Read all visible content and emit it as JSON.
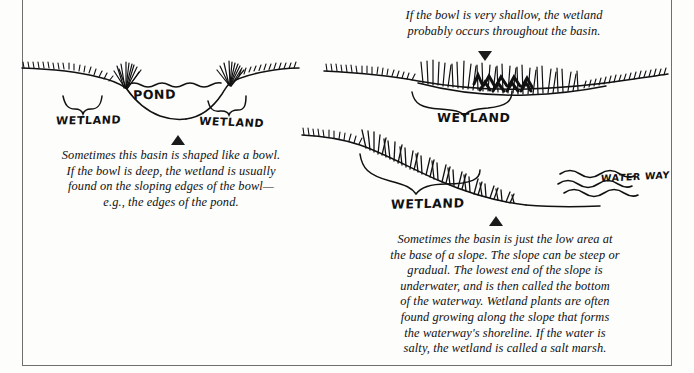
{
  "page": {
    "width": 694,
    "height": 373,
    "background_color": "#fdfdfc",
    "ink_color": "#111111",
    "rule_color": "#6f6f6f"
  },
  "figures": {
    "pond": {
      "name": "bowl-shaped basin with pond",
      "labels": {
        "water": "POND",
        "wetland_left": "WETLAND",
        "wetland_right": "WETLAND"
      },
      "marker": "triangle-up",
      "caption": [
        "Sometimes this basin is shaped like a bowl.",
        "If the bowl is deep, the wetland is usually",
        "found on the sloping edges of the bowl—",
        "e.g., the edges of the pond."
      ]
    },
    "shallow": {
      "name": "very shallow basin filled with wetland",
      "labels": {
        "wetland": "WETLAND"
      },
      "marker": "triangle-down",
      "caption": [
        "If the bowl is very shallow, the wetland",
        "probably occurs throughout the basin."
      ]
    },
    "slope": {
      "name": "low area at base of a slope beside a waterway",
      "labels": {
        "wetland": "WETLAND",
        "waterway": "WATER WAY"
      },
      "marker": "triangle-up",
      "caption": [
        "Sometimes the basin is just the low area at",
        "the base of a slope. The slope can be steep or",
        "gradual. The lowest end of the slope is",
        "underwater, and is then called the bottom",
        "of the waterway. Wetland plants are often",
        "found growing along the slope that forms",
        "the waterway's shoreline. If the water is",
        "salty, the wetland is called a salt marsh."
      ]
    }
  }
}
